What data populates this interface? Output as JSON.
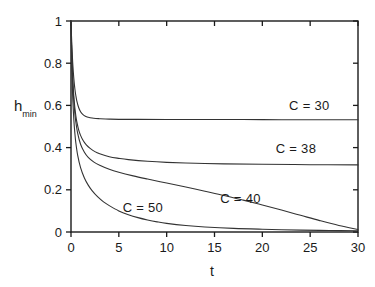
{
  "chart_data": {
    "type": "line",
    "title": "",
    "subtitle": "",
    "xlabel": "t",
    "ylabel": "h_min",
    "ylabel_base": "h",
    "ylabel_sub": "min",
    "xlim": [
      0,
      30
    ],
    "ylim": [
      0,
      1
    ],
    "xticks": [
      0,
      5,
      10,
      15,
      20,
      25,
      30
    ],
    "yticks": [
      0,
      0.2,
      0.4,
      0.6,
      0.8,
      1
    ],
    "xtick_labels": [
      "0",
      "5",
      "10",
      "15",
      "20",
      "25",
      "30"
    ],
    "ytick_labels": [
      "0",
      "0.2",
      "0.4",
      "0.6",
      "0.8",
      "1"
    ],
    "grid": false,
    "legend_position": "inline-annotations",
    "line_color": "#333333",
    "axis_color": "#1a1a1a",
    "background": "#ffffff",
    "annotations": [
      {
        "text": "C = 30",
        "x": 22.8,
        "y": 0.595
      },
      {
        "text": "C = 38",
        "x": 21.4,
        "y": 0.395
      },
      {
        "text": "C = 40",
        "x": 15.6,
        "y": 0.155
      },
      {
        "text": "C = 50",
        "x": 5.4,
        "y": 0.115
      }
    ],
    "series": [
      {
        "name": "C = 30",
        "label": "C = 30",
        "asymptote": 0.53,
        "x": [
          0,
          0.05,
          0.1,
          0.15,
          0.2,
          0.3,
          0.4,
          0.5,
          0.6,
          0.8,
          1.0,
          1.2,
          1.5,
          1.8,
          2.2,
          2.6,
          3.0,
          4.0,
          5.0,
          7.0,
          10.0,
          14.0,
          18.0,
          22.0,
          26.0,
          30.0
        ],
        "y": [
          1.0,
          0.93,
          0.873,
          0.826,
          0.787,
          0.725,
          0.68,
          0.648,
          0.623,
          0.59,
          0.57,
          0.559,
          0.549,
          0.544,
          0.54,
          0.538,
          0.537,
          0.535,
          0.534,
          0.534,
          0.533,
          0.533,
          0.533,
          0.532,
          0.532,
          0.532
        ]
      },
      {
        "name": "C = 38",
        "label": "C = 38",
        "asymptote": 0.318,
        "x": [
          0,
          0.05,
          0.1,
          0.15,
          0.2,
          0.3,
          0.4,
          0.5,
          0.6,
          0.8,
          1.0,
          1.3,
          1.6,
          2.0,
          2.5,
          3.0,
          4.0,
          5.0,
          6.0,
          8.0,
          10.0,
          13.0,
          16.0,
          20.0,
          25.0,
          30.0
        ],
        "y": [
          1.0,
          0.9,
          0.822,
          0.762,
          0.714,
          0.641,
          0.59,
          0.553,
          0.524,
          0.484,
          0.458,
          0.431,
          0.413,
          0.396,
          0.381,
          0.371,
          0.357,
          0.349,
          0.343,
          0.335,
          0.33,
          0.326,
          0.323,
          0.321,
          0.319,
          0.318
        ]
      },
      {
        "name": "C = 40",
        "label": "C = 40",
        "asymptote": 0.0,
        "x": [
          0,
          0.05,
          0.1,
          0.15,
          0.2,
          0.3,
          0.4,
          0.5,
          0.7,
          1.0,
          1.4,
          1.8,
          2.4,
          3.0,
          4.0,
          5.0,
          6.5,
          8.0,
          10.0,
          12.0,
          14.0,
          16.0,
          18.0,
          20.0,
          22.0,
          24.0,
          26.0,
          28.0,
          30.0
        ],
        "y": [
          1.0,
          0.89,
          0.806,
          0.743,
          0.693,
          0.617,
          0.563,
          0.523,
          0.467,
          0.416,
          0.378,
          0.354,
          0.331,
          0.316,
          0.297,
          0.283,
          0.266,
          0.251,
          0.232,
          0.213,
          0.193,
          0.173,
          0.151,
          0.128,
          0.104,
          0.079,
          0.054,
          0.031,
          0.012
        ]
      },
      {
        "name": "C = 50",
        "label": "C = 50",
        "asymptote": 0.0,
        "x": [
          0,
          0.05,
          0.1,
          0.15,
          0.2,
          0.3,
          0.4,
          0.5,
          0.7,
          1.0,
          1.4,
          1.8,
          2.2,
          2.8,
          3.4,
          4.0,
          5.0,
          6.0,
          7.0,
          8.0,
          9.0,
          10.0,
          12.0,
          14.0,
          17.0,
          20.0,
          24.0,
          27.0,
          30.0
        ],
        "y": [
          1.0,
          0.855,
          0.75,
          0.675,
          0.616,
          0.53,
          0.47,
          0.425,
          0.363,
          0.305,
          0.256,
          0.222,
          0.196,
          0.166,
          0.143,
          0.125,
          0.1,
          0.082,
          0.068,
          0.057,
          0.048,
          0.041,
          0.031,
          0.024,
          0.017,
          0.013,
          0.009,
          0.007,
          0.006
        ]
      }
    ]
  },
  "plot_geometry": {
    "left": 71,
    "right": 358,
    "top": 21,
    "bottom": 232
  }
}
